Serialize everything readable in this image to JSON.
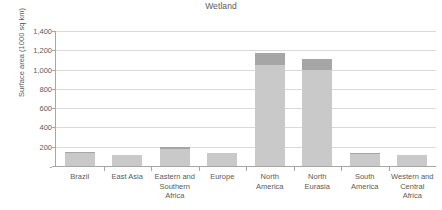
{
  "chart_data": {
    "type": "bar",
    "title": "Wetland",
    "xlabel": "",
    "ylabel": "Surface area (1000 sq km)",
    "ylim": [
      0,
      1400
    ],
    "ytick_labels": [
      "1,400",
      "1,200",
      "1,000",
      "800",
      "600",
      "400",
      "200",
      "-"
    ],
    "ytick_values": [
      1400,
      1200,
      1000,
      800,
      600,
      400,
      200,
      0
    ],
    "grid": true,
    "legend": "none",
    "stacked": true,
    "categories": [
      "Brazil",
      "East Asia",
      "Eastern and Southern Africa",
      "Europe",
      "North America",
      "North Eurasia",
      "South America",
      "Western and Central Africa"
    ],
    "category_lines": [
      [
        "Brazil"
      ],
      [
        "East Asia"
      ],
      [
        "Eastern and",
        "Southern",
        "Africa"
      ],
      [
        "Europe"
      ],
      [
        "North",
        "America"
      ],
      [
        "North",
        "Eurasia"
      ],
      [
        "South",
        "America"
      ],
      [
        "Western and",
        "Central",
        "Africa"
      ]
    ],
    "series": [
      {
        "name": "lower",
        "color": "#c9c9c9",
        "values": [
          135,
          110,
          175,
          140,
          1050,
          1000,
          128,
          110
        ]
      },
      {
        "name": "upper",
        "color": "#a6a6a6",
        "values": [
          15,
          8,
          18,
          0,
          120,
          110,
          12,
          0
        ]
      }
    ],
    "totals": [
      150,
      118,
      193,
      140,
      1170,
      1110,
      140,
      110
    ]
  },
  "style": {
    "gridline_color": "#d9d9d9",
    "axis_color": "#a6a6a6",
    "text_color": "#5a5a5a",
    "background": "#ffffff"
  }
}
